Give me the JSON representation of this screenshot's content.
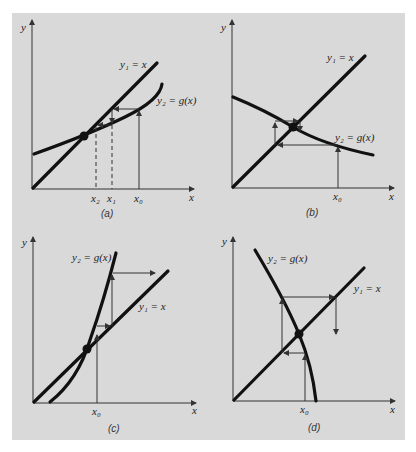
{
  "figure": {
    "background_color": "#d9d9d9",
    "panels": [
      {
        "id": "a",
        "caption": "(a)",
        "y_axis_label": "y",
        "x_axis_label": "x",
        "line_label": "y₁ = x",
        "curve_label": "y₂ = g(x)",
        "tick_labels": [
          "x₂",
          "x₁",
          "x₀"
        ],
        "behavior": "monotone convergence"
      },
      {
        "id": "b",
        "caption": "(b)",
        "y_axis_label": "y",
        "x_axis_label": "x",
        "line_label": "y₁ = x",
        "curve_label": "y₂ = g(x)",
        "tick_labels": [
          "x₀"
        ],
        "behavior": "oscillating convergence"
      },
      {
        "id": "c",
        "caption": "(c)",
        "y_axis_label": "y",
        "x_axis_label": "x",
        "line_label": "y₁ = x",
        "curve_label": "y₂ = g(x)",
        "tick_labels": [
          "x₀"
        ],
        "behavior": "monotone divergence"
      },
      {
        "id": "d",
        "caption": "(d)",
        "y_axis_label": "y",
        "x_axis_label": "x",
        "line_label": "y₁ = x",
        "curve_label": "y₂ = g(x)",
        "tick_labels": [
          "x₀"
        ],
        "behavior": "oscillating divergence"
      }
    ]
  }
}
